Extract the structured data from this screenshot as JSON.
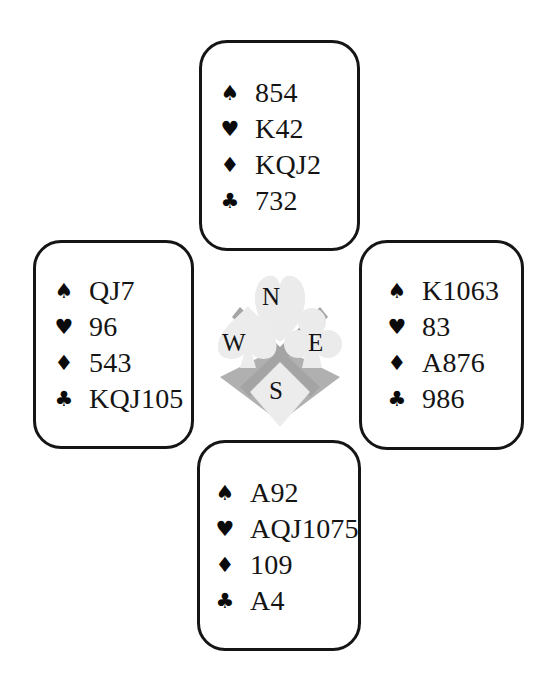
{
  "hands": {
    "north": {
      "label": "North",
      "spades": "854",
      "hearts": "K42",
      "diamonds": "KQJ2",
      "clubs": "732"
    },
    "west": {
      "label": "West",
      "spades": "QJ7",
      "hearts": "96",
      "diamonds": "543",
      "clubs": "KQJ105"
    },
    "east": {
      "label": "East",
      "spades": "K1063",
      "hearts": "83",
      "diamonds": "A876",
      "clubs": "986"
    },
    "south": {
      "label": "South",
      "spades": "A92",
      "hearts": "AQJ1075",
      "diamonds": "109",
      "clubs": "A4"
    }
  },
  "suits": {
    "spades": "♠",
    "hearts": "♥",
    "diamonds": "♦",
    "clubs": "♣"
  },
  "compass": {
    "north": "N",
    "west": "W",
    "east": "E",
    "south": "S"
  },
  "colors": {
    "border": "#151515",
    "text": "#141414",
    "compass_dark_gray": "#a8a8a8",
    "compass_light_gray": "#e6e6e6"
  }
}
